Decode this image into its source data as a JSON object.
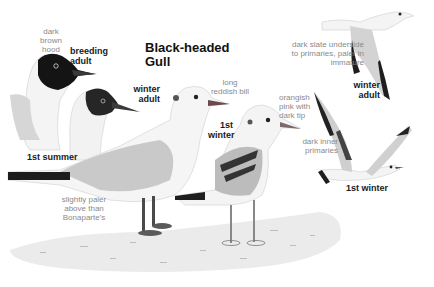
{
  "plate": {
    "title_line1": "Black-headed",
    "title_line2": "Gull",
    "colors": {
      "hood": "#141414",
      "mantle": "#c9c9c9",
      "ground": "#e6e6e6",
      "label_gray": "#8a8a8a",
      "label_dark": "#1a1a1a"
    }
  },
  "labels": {
    "hood_note": [
      "dark",
      "brown",
      "hood"
    ],
    "breeding_adult": [
      "breeding",
      "adult"
    ],
    "winter_adult_standing": [
      "winter",
      "adult"
    ],
    "bill_note": [
      "long",
      "reddish bill"
    ],
    "first_winter_standing": [
      "1st",
      "winter"
    ],
    "bill_tip_note": [
      "orangish",
      "pink with",
      "dark tip"
    ],
    "underside_note": [
      "dark slate underside",
      "to primaries, paler in",
      "immature"
    ],
    "winter_adult_flying": [
      "winter",
      "adult"
    ],
    "inner_primaries_note": [
      "dark inner",
      "primaries"
    ],
    "first_winter_flying": "1st winter",
    "first_summer": "1st summer",
    "paler_note": [
      "slightly paler",
      "above than",
      "Bonaparte's"
    ]
  }
}
